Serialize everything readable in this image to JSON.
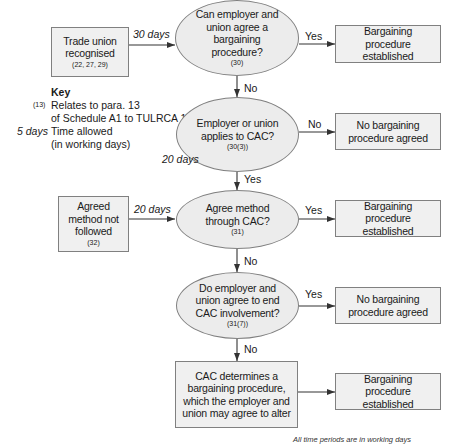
{
  "nodes": {
    "trade_union": {
      "text": "Trade union recognised",
      "ref": "(22, 27, 29)"
    },
    "q_agree": {
      "text": "Can employer and union agree a bargaining procedure?",
      "ref": "(30)"
    },
    "r_established_1": {
      "text": "Bargaining procedure established"
    },
    "q_applies": {
      "text": "Employer or union applies to CAC?",
      "ref": "(30(3))"
    },
    "r_none_1": {
      "text": "No bargaining procedure agreed"
    },
    "agreed_not_followed": {
      "text": "Agreed method not followed",
      "ref": "(32)"
    },
    "q_method": {
      "text": "Agree method through CAC?",
      "ref": "(31)"
    },
    "r_established_2": {
      "text": "Bargaining procedure established"
    },
    "q_end": {
      "text": "Do employer and union agree to end CAC involvement?",
      "ref": "(31(7))"
    },
    "r_none_2": {
      "text": "No bargaining procedure agreed"
    },
    "cac_determines": {
      "text": "CAC determines a bargaining procedure, which the employer and union may agree to alter"
    },
    "r_established_3": {
      "text": "Bargaining procedure established"
    }
  },
  "edges": {
    "e1": {
      "label": "30 days"
    },
    "e2": {
      "label": "Yes"
    },
    "e3": {
      "label": "No"
    },
    "e4": {
      "label": "No"
    },
    "e5": {
      "label": "Yes"
    },
    "e6": {
      "label": "20 days"
    },
    "e7": {
      "label": "20 days"
    },
    "e8": {
      "label": "Yes"
    },
    "e9": {
      "label": "No"
    },
    "e10": {
      "label": "Yes"
    },
    "e11": {
      "label": "No"
    }
  },
  "key": {
    "title": "Key",
    "ref_sample": "(13)",
    "ref_desc_1": "Relates to para. 13",
    "ref_desc_2": "of Schedule A1 to TULRCA 1992",
    "days_sample": "5 days",
    "days_desc_1": "Time allowed",
    "days_desc_2": "(in working days)"
  },
  "footer": "All time periods are in working days",
  "colors": {
    "box_fill": "#f0f0f0",
    "ellipse_fill": "#ececec",
    "stroke": "#808080",
    "line": "#333333"
  }
}
